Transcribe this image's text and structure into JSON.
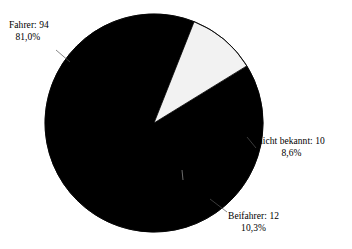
{
  "chart_data": {
    "type": "pie",
    "title": "",
    "subtitle": "",
    "xlabel": "",
    "ylabel": "",
    "legend_position": "none",
    "grid": false,
    "total": 116,
    "categories": [
      "Fahrer",
      "nicht bekannt",
      "Beifahrer"
    ],
    "values": [
      94,
      10,
      12
    ],
    "percent_labels": [
      "81,0%",
      "8,6%",
      "10,3%"
    ],
    "slices": [
      {
        "name": "Fahrer",
        "value": 94,
        "percent": 81.0,
        "percent_label": "81,0%",
        "label_line1": "Fahrer: 94",
        "label_line2": "81,0%",
        "color": "#000000",
        "start_angle_deg": 0,
        "sweep_deg": 291.6
      },
      {
        "name": "nicht bekannt",
        "value": 10,
        "percent": 8.6,
        "percent_label": "8,6%",
        "label_line1": "nicht bekannt: 10",
        "label_line2": "8,6%",
        "color": "#000000",
        "start_angle_deg": 328.4,
        "sweep_deg": 31.6
      },
      {
        "name": "Beifahrer",
        "value": 12,
        "percent": 10.3,
        "percent_label": "10,3%",
        "label_line1": "Beifahrer: 12",
        "label_line2": "10,3%",
        "color": "#f2f2f2",
        "start_angle_deg": 291.6,
        "sweep_deg": 36.8
      }
    ],
    "geometry": {
      "center_x": 154,
      "center_y": 123,
      "radius": 109
    },
    "colors": {
      "background": "#ffffff",
      "outline": "#000000",
      "slice_dark": "#000000",
      "slice_light": "#f2f2f2",
      "text": "#000000"
    }
  }
}
